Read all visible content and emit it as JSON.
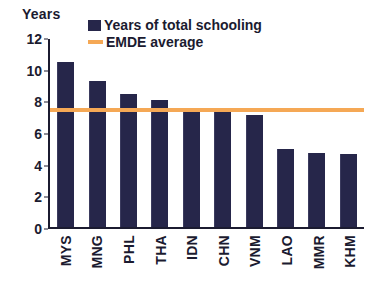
{
  "chart_data": {
    "type": "bar",
    "title": "",
    "xlabel": "",
    "ylabel": "Years",
    "ylim": [
      0,
      12
    ],
    "yticks": [
      12,
      10,
      8,
      6,
      4,
      2,
      0
    ],
    "grid": false,
    "legend_position": "top-center",
    "categories": [
      "MYS",
      "MNG",
      "PHL",
      "THA",
      "IDN",
      "CHN",
      "VNM",
      "LAO",
      "MMR",
      "KHM"
    ],
    "series": [
      {
        "name": "Years of total schooling",
        "type": "bar",
        "color": "#26264a",
        "values": [
          10.4,
          9.2,
          8.4,
          8.0,
          7.4,
          7.4,
          7.1,
          4.9,
          4.7,
          4.6
        ]
      },
      {
        "name": "EMDE average",
        "type": "line",
        "color": "#f5a855",
        "value": 7.5
      }
    ]
  },
  "legend": {
    "items": [
      {
        "label": "Years of total schooling",
        "marker": "square-swatch",
        "color": "#26264a"
      },
      {
        "label": "EMDE average",
        "marker": "line-swatch",
        "color": "#f5a855"
      }
    ]
  },
  "axis": {
    "unit_label": "Years"
  }
}
